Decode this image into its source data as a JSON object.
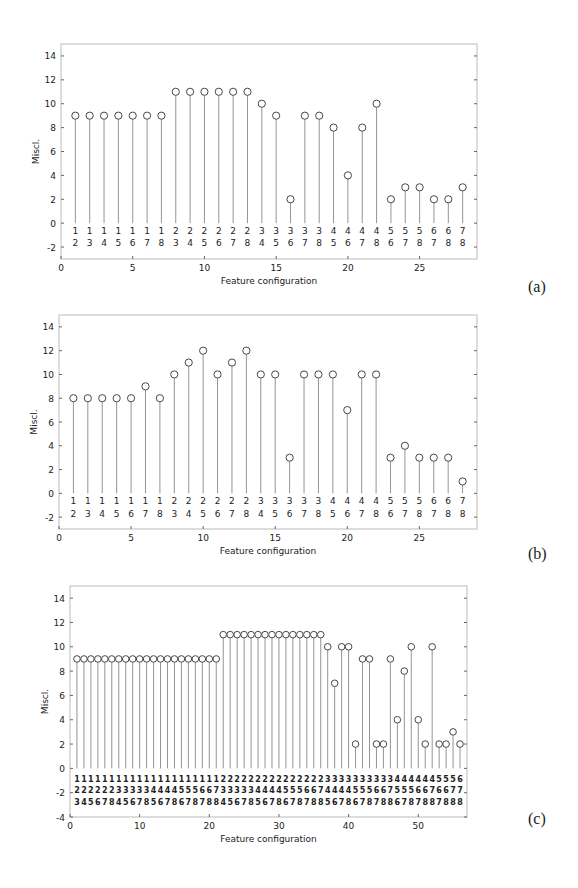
{
  "chart_data": [
    {
      "type": "stem",
      "panel_label": "(a)",
      "title": "",
      "xlabel": "Feature configuration",
      "ylabel": "Miscl.",
      "xlim": [
        0,
        29
      ],
      "ylim": [
        -3,
        15
      ],
      "yticks": [
        -2,
        0,
        2,
        4,
        6,
        8,
        10,
        12,
        14
      ],
      "xticks": [
        0,
        5,
        10,
        15,
        20,
        25
      ],
      "grid": false,
      "x": [
        1,
        2,
        3,
        4,
        5,
        6,
        7,
        8,
        9,
        10,
        11,
        12,
        13,
        14,
        15,
        16,
        17,
        18,
        19,
        20,
        21,
        22,
        23,
        24,
        25,
        26,
        27,
        28
      ],
      "values": [
        9,
        9,
        9,
        9,
        9,
        9,
        9,
        11,
        11,
        11,
        11,
        11,
        11,
        10,
        9,
        2,
        9,
        9,
        8,
        4,
        8,
        10,
        2,
        3,
        3,
        2,
        2,
        3
      ],
      "config_labels": [
        "12",
        "13",
        "14",
        "15",
        "16",
        "17",
        "18",
        "23",
        "24",
        "25",
        "26",
        "27",
        "28",
        "34",
        "35",
        "36",
        "37",
        "38",
        "45",
        "46",
        "47",
        "48",
        "56",
        "57",
        "58",
        "67",
        "68",
        "78"
      ]
    },
    {
      "type": "stem",
      "panel_label": "(b)",
      "title": "",
      "xlabel": "Feature configuration",
      "ylabel": "Miscl.",
      "xlim": [
        0,
        29
      ],
      "ylim": [
        -3,
        15
      ],
      "yticks": [
        -2,
        0,
        2,
        4,
        6,
        8,
        10,
        12,
        14
      ],
      "xticks": [
        0,
        5,
        10,
        15,
        20,
        25
      ],
      "grid": false,
      "x": [
        1,
        2,
        3,
        4,
        5,
        6,
        7,
        8,
        9,
        10,
        11,
        12,
        13,
        14,
        15,
        16,
        17,
        18,
        19,
        20,
        21,
        22,
        23,
        24,
        25,
        26,
        27,
        28
      ],
      "values": [
        8,
        8,
        8,
        8,
        8,
        9,
        8,
        10,
        11,
        12,
        10,
        11,
        12,
        10,
        10,
        3,
        10,
        10,
        10,
        7,
        10,
        10,
        3,
        4,
        3,
        3,
        3,
        1
      ],
      "config_labels": [
        "12",
        "13",
        "14",
        "15",
        "16",
        "17",
        "18",
        "23",
        "24",
        "25",
        "26",
        "27",
        "28",
        "34",
        "35",
        "36",
        "37",
        "38",
        "45",
        "46",
        "47",
        "48",
        "56",
        "57",
        "58",
        "67",
        "68",
        "78"
      ]
    },
    {
      "type": "stem",
      "panel_label": "(c)",
      "title": "",
      "xlabel": "Feature configuration",
      "ylabel": "Miscl.",
      "xlim": [
        0,
        57
      ],
      "ylim": [
        -4,
        15
      ],
      "yticks": [
        -4,
        -2,
        0,
        2,
        4,
        6,
        8,
        10,
        12,
        14
      ],
      "xticks": [
        0,
        10,
        20,
        30,
        40,
        50
      ],
      "grid": false,
      "x": [
        1,
        2,
        3,
        4,
        5,
        6,
        7,
        8,
        9,
        10,
        11,
        12,
        13,
        14,
        15,
        16,
        17,
        18,
        19,
        20,
        21,
        22,
        23,
        24,
        25,
        26,
        27,
        28,
        29,
        30,
        31,
        32,
        33,
        34,
        35,
        36,
        37,
        38,
        39,
        40,
        41,
        42,
        43,
        44,
        45,
        46,
        47,
        48,
        49,
        50,
        51,
        52,
        53,
        54,
        55,
        56
      ],
      "values": [
        9,
        9,
        9,
        9,
        9,
        9,
        9,
        9,
        9,
        9,
        9,
        9,
        9,
        9,
        9,
        9,
        9,
        9,
        9,
        9,
        9,
        11,
        11,
        11,
        11,
        11,
        11,
        11,
        11,
        11,
        11,
        11,
        11,
        11,
        11,
        11,
        10,
        7,
        10,
        10,
        2,
        9,
        9,
        2,
        2,
        9,
        4,
        8,
        10,
        4,
        2,
        10,
        2,
        2,
        3,
        2
      ],
      "config_labels": [
        "123",
        "124",
        "125",
        "126",
        "127",
        "128",
        "134",
        "135",
        "136",
        "137",
        "138",
        "145",
        "146",
        "147",
        "148",
        "156",
        "157",
        "158",
        "167",
        "168",
        "178",
        "234",
        "235",
        "236",
        "237",
        "238",
        "245",
        "246",
        "247",
        "248",
        "256",
        "257",
        "258",
        "267",
        "268",
        "278",
        "345",
        "346",
        "347",
        "348",
        "356",
        "357",
        "358",
        "367",
        "368",
        "378",
        "456",
        "457",
        "458",
        "467",
        "468",
        "478",
        "567",
        "568",
        "578",
        "678"
      ]
    }
  ]
}
